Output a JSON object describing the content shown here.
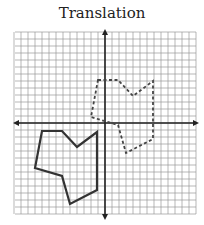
{
  "title": "Translation",
  "grid": {
    "origin_px": [
      105,
      123
    ],
    "spacing_px": 7,
    "x_range": [
      -13,
      13
    ],
    "y_range": [
      -13,
      13
    ],
    "grid_color": "#9a9a9a",
    "axis_color": "#222222"
  },
  "shapes": {
    "preimage": {
      "style": "solid",
      "color": "#333333",
      "points_px": [
        [
          42,
          131
        ],
        [
          62,
          131
        ],
        [
          77,
          147
        ],
        [
          97,
          132
        ],
        [
          97,
          190
        ],
        [
          70,
          204
        ],
        [
          62,
          176
        ],
        [
          35,
          168
        ]
      ]
    },
    "image": {
      "style": "dashed",
      "color": "#444444",
      "translation_px": [
        56,
        -51
      ]
    }
  }
}
